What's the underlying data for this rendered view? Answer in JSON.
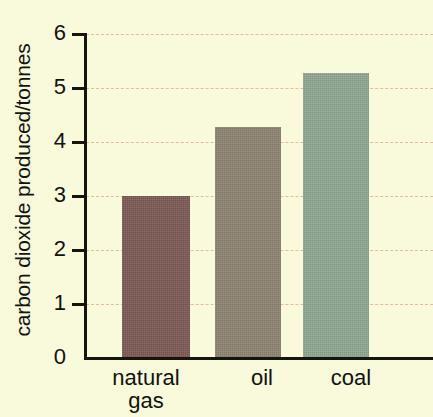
{
  "chart_data": {
    "type": "bar",
    "title": "",
    "xlabel": "",
    "ylabel": "carbon dioxide produced/tonnes",
    "categories": [
      "natural gas",
      "oil",
      "coal"
    ],
    "values": [
      3.0,
      4.28,
      5.28
    ],
    "ylim": [
      0,
      6
    ],
    "yticks": [
      0,
      1,
      2,
      3,
      4,
      5,
      6
    ],
    "ytick_labels": [
      "0",
      "1",
      "2",
      "3",
      "4",
      "5",
      "6"
    ],
    "grid": true,
    "legend": "none",
    "bar_colors": [
      "#7d5a55",
      "#8d8471",
      "#8fa893"
    ],
    "background_color": "#f9f9dc",
    "gridline_color": "#e0a58c",
    "axis_color": "#15150e"
  },
  "axis": {
    "y_title": "carbon dioxide produced/tonnes",
    "tick_6": "6",
    "tick_5": "5",
    "tick_4": "4",
    "tick_3": "3",
    "tick_2": "2",
    "tick_1": "1",
    "tick_0": "0"
  },
  "bars": {
    "gas_label_line1": "natural",
    "gas_label_line2": "gas",
    "oil_label": "oil",
    "coal_label": "coal"
  }
}
